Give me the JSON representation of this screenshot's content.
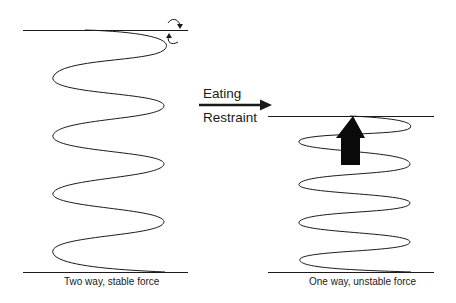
{
  "diagram": {
    "left_panel": {
      "caption": "Two way, stable force",
      "rotation_arrows": [
        "clockwise-arrow",
        "counterclockwise-arrow"
      ]
    },
    "transition": {
      "label_top": "Eating",
      "label_bottom": "Restraint",
      "arrow_direction": "right"
    },
    "right_panel": {
      "caption": "One way, unstable force",
      "force_arrow_direction": "up"
    },
    "colors": {
      "line": "#1a1a1a",
      "background": "#ffffff"
    }
  }
}
